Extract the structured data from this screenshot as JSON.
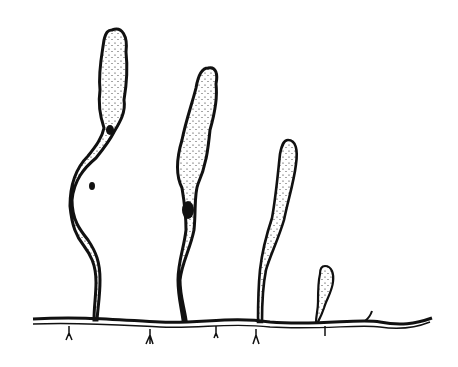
{
  "figure": {
    "ink_color": "#111111",
    "background": "#ffffff",
    "fronds": [
      {
        "id": 1,
        "description": "tallest frond, twisted, stippled"
      },
      {
        "id": 2,
        "description": "tall frond with dark constriction"
      },
      {
        "id": 3,
        "description": "medium smooth club-shaped frond"
      },
      {
        "id": 4,
        "description": "small young club-shaped frond"
      }
    ],
    "rhizoid_count": 5
  }
}
